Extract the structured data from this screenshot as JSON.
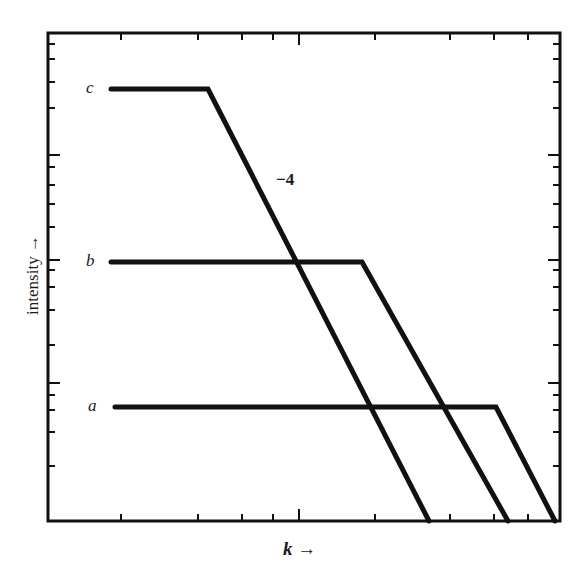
{
  "chart_data": {
    "type": "line",
    "title": "",
    "xlabel": "k →",
    "ylabel": "intensity →",
    "grid": false,
    "legend": "none (curves labelled inline a, b, c)",
    "annotations": [
      {
        "text": "−4",
        "meaning": "slope of falling segments (log-log)"
      }
    ],
    "axes": {
      "x_scale": "log (unlabelled ticks)",
      "y_scale": "log (unlabelled ticks)",
      "tick_labels": "none"
    },
    "series": [
      {
        "name": "c",
        "points_px": [
          [
            111,
            89
          ],
          [
            208,
            89
          ],
          [
            429,
            521
          ]
        ],
        "description": "flat plateau then slope −4 fall"
      },
      {
        "name": "b",
        "points_px": [
          [
            111,
            262
          ],
          [
            362,
            262
          ],
          [
            508,
            521
          ]
        ],
        "description": "flat plateau then slope −4 fall"
      },
      {
        "name": "a",
        "points_px": [
          [
            115,
            407
          ],
          [
            496,
            407
          ],
          [
            555,
            521
          ]
        ],
        "description": "flat plateau then slope −4 fall"
      }
    ]
  },
  "labels": {
    "curve_c": "c",
    "curve_b": "b",
    "curve_a": "a",
    "slope": "−4",
    "ylabel": "intensity →",
    "xlabel_k": "k",
    "xlabel_arrow": " →"
  },
  "frame": {
    "left": 48,
    "right": 560,
    "top": 33,
    "bottom": 521
  },
  "x_ticks": [
    121,
    198,
    242,
    273,
    299,
    375,
    450,
    494,
    528
  ],
  "x_major": [
    299
  ],
  "y_ticks": [
    44,
    59,
    82,
    108,
    155,
    167,
    185,
    204,
    227,
    260,
    270,
    287,
    310,
    345,
    383,
    395,
    410,
    432,
    466
  ],
  "y_major": [
    155,
    260,
    383
  ],
  "colors": {
    "ink": "#111111",
    "background": "#ffffff"
  }
}
